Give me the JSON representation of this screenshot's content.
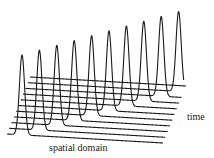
{
  "diagram": {
    "type": "waterfall-plot",
    "labels": {
      "x_axis": "spatial domain",
      "depth_axis": "time"
    },
    "style": {
      "stroke": "#1a1a1a",
      "stroke_width": 1.1,
      "background": "#ffffff"
    },
    "traces": {
      "count": 11,
      "front_baseline_start": [
        7,
        134
      ],
      "front_baseline_end": [
        163,
        143
      ],
      "offset_per_trace": [
        2.3,
        -5.7
      ],
      "first_peak_x_along_baseline": 15,
      "peak_shift_per_trace": 15.1,
      "peak_height": 80,
      "pulse_width_sigma": 2.6
    }
  }
}
